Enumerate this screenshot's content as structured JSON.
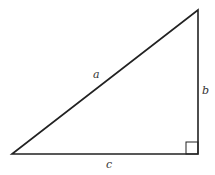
{
  "diagram": {
    "type": "right-triangle",
    "labels": {
      "hypotenuse": "a",
      "vertical_side": "b",
      "base": "c"
    },
    "right_angle_marker": true,
    "stroke_color": "#222222",
    "background": "#ffffff"
  }
}
